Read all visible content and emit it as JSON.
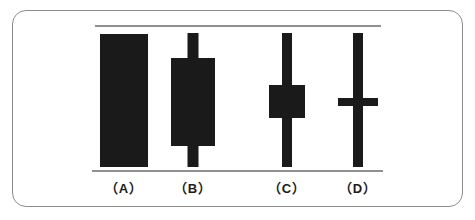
{
  "figure": {
    "frame": {
      "border_color": "#8c8c8c",
      "background_color": "#ffffff"
    },
    "ink_color": "#1a1a1a",
    "reference_line_color": "#909090"
  },
  "reference_lines": {
    "top_label": "high reference line",
    "bottom_label": "low reference line"
  },
  "candles": [
    {
      "label": "（A）",
      "name": "candle-a",
      "description": "long solid body spanning full range, no visible wicks (marubozu)",
      "center_x": 124,
      "body_width": 48,
      "wick_width": 0,
      "high_y": 34,
      "low_y": 167,
      "body_top_y": 34,
      "body_bottom_y": 167,
      "has_upper_wick": false,
      "has_lower_wick": false,
      "body_type": "filled"
    },
    {
      "label": "（B）",
      "name": "candle-b",
      "description": "large solid body with short upper and lower wicks",
      "center_x": 193,
      "body_width": 44,
      "wick_width": 11,
      "high_y": 33,
      "low_y": 167,
      "body_top_y": 58,
      "body_bottom_y": 146,
      "has_upper_wick": true,
      "has_lower_wick": true,
      "body_type": "filled"
    },
    {
      "label": "（C）",
      "name": "candle-c",
      "description": "small solid body with long upper and lower wicks (spinning top)",
      "center_x": 287,
      "body_width": 36,
      "wick_width": 10,
      "high_y": 33,
      "low_y": 167,
      "body_top_y": 85,
      "body_bottom_y": 118,
      "has_upper_wick": true,
      "has_lower_wick": true,
      "body_type": "filled"
    },
    {
      "label": "（D）",
      "name": "candle-d",
      "description": "no body, open equals close, long wicks forming a cross (doji)",
      "center_x": 358,
      "body_width": 40,
      "wick_width": 10,
      "high_y": 33,
      "low_y": 167,
      "body_top_y": 98,
      "body_bottom_y": 106,
      "has_upper_wick": true,
      "has_lower_wick": true,
      "body_type": "doji-cross"
    }
  ],
  "chart_data": {
    "type": "bar",
    "xlabel": "",
    "ylabel": "",
    "categories": [
      "（A）",
      "（B）",
      "（C）",
      "（D）"
    ],
    "series": [
      {
        "name": "high",
        "values": [
          167,
          167,
          167,
          167
        ]
      },
      {
        "name": "body_top",
        "values": [
          167,
          142,
          115,
          105
        ]
      },
      {
        "name": "body_bottom",
        "values": [
          34,
          54,
          82,
          97
        ]
      },
      {
        "name": "low",
        "values": [
          34,
          34,
          34,
          34
        ]
      }
    ],
    "grid": false,
    "legend": "none"
  }
}
